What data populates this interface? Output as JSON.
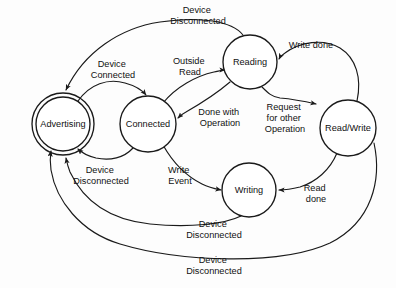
{
  "diagram": {
    "type": "state-machine-diagram",
    "canvas": {
      "width": 396,
      "height": 288
    },
    "colors": {
      "stroke": "#1a1a1a",
      "text": "#111111",
      "background": "#fdfdfd",
      "node_fill": "#ffffff"
    },
    "nodes": [
      {
        "id": "advertising",
        "label": "Advertising",
        "cx": 63,
        "cy": 124,
        "r": 27,
        "double_ring": true,
        "ring_gap": 4
      },
      {
        "id": "connected",
        "label": "Connected",
        "cx": 148,
        "cy": 124,
        "r": 28,
        "double_ring": false,
        "ring_gap": 0
      },
      {
        "id": "reading",
        "label": "Reading",
        "cx": 250,
        "cy": 62,
        "r": 27,
        "double_ring": false,
        "ring_gap": 0
      },
      {
        "id": "readwrite",
        "label": "Read/Write",
        "cx": 348,
        "cy": 128,
        "r": 28,
        "double_ring": false,
        "ring_gap": 0
      },
      {
        "id": "writing",
        "label": "Writing",
        "cx": 249,
        "cy": 190,
        "r": 27,
        "double_ring": false,
        "ring_gap": 0
      }
    ],
    "edges": [
      {
        "id": "e-disconnected-top",
        "from": "reading",
        "to": "advertising",
        "label": "Device Disconnected",
        "label_lines": [
          "Device",
          "Disconnected"
        ],
        "label_x": 198,
        "label_y": 13
      },
      {
        "id": "e-device-connected",
        "from": "advertising",
        "to": "connected",
        "label": "Device Connected",
        "label_lines": [
          "Device",
          "Connected"
        ],
        "label_x": 113,
        "label_y": 67
      },
      {
        "id": "e-outside-read",
        "from": "connected",
        "to": "reading",
        "label": "Outside Read",
        "label_lines": [
          "Outside",
          "Read"
        ],
        "label_x": 190,
        "label_y": 64
      },
      {
        "id": "e-write-done",
        "from": "readwrite",
        "to": "reading",
        "label": "Write done",
        "label_lines": [
          "Write done"
        ],
        "label_x": 311,
        "label_y": 48
      },
      {
        "id": "e-done-with-operation",
        "from": "reading",
        "to": "connected",
        "label": "Done with Operation",
        "label_lines": [
          "Done with",
          "Operation"
        ],
        "label_x": 220,
        "label_y": 115
      },
      {
        "id": "e-request-other-op",
        "from": "reading",
        "to": "readwrite",
        "label": "Request for other Operation",
        "label_lines": [
          "Request",
          "for other",
          "Operation"
        ],
        "label_x": 285,
        "label_y": 110
      },
      {
        "id": "e-device-disc-adv",
        "from": "connected",
        "to": "advertising",
        "label": "Device Disconnected",
        "label_lines": [
          "Device",
          "Disconnected"
        ],
        "label_x": 101,
        "label_y": 173
      },
      {
        "id": "e-write-event",
        "from": "connected",
        "to": "writing",
        "label": "Write Event",
        "label_lines": [
          "Write",
          "Event"
        ],
        "label_x": 180,
        "label_y": 173
      },
      {
        "id": "e-read-done",
        "from": "readwrite",
        "to": "writing",
        "label": "Read done",
        "label_lines": [
          "Read",
          "done"
        ],
        "label_x": 316,
        "label_y": 191
      },
      {
        "id": "e-disconnected-mid",
        "from": "writing",
        "to": "advertising",
        "label": "Device Disconnected",
        "label_lines": [
          "Device",
          "Disconnected"
        ],
        "label_x": 214,
        "label_y": 227
      },
      {
        "id": "e-disconnected-bottom",
        "from": "readwrite",
        "to": "advertising",
        "label": "Device Disconnected",
        "label_lines": [
          "Device",
          "Disconnected"
        ],
        "label_x": 214,
        "label_y": 263
      }
    ]
  }
}
